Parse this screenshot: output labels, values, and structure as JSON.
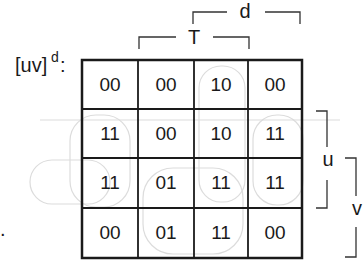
{
  "title": {
    "base": "[uv]",
    "superscript": "d",
    "suffix": ":"
  },
  "bracket_labels": {
    "d": "d",
    "T": "T",
    "u": "u",
    "v": "v"
  },
  "grid": {
    "rows": [
      [
        "00",
        "00",
        "10",
        "00"
      ],
      [
        "11",
        "00",
        "10",
        "11"
      ],
      [
        "11",
        "01",
        "11",
        "11"
      ],
      [
        "00",
        "01",
        "11",
        "00"
      ]
    ]
  },
  "colors": {
    "line": "#1a1a1a",
    "bracket": "#333333",
    "loop": "#d8d8d8"
  },
  "side_mark": "."
}
